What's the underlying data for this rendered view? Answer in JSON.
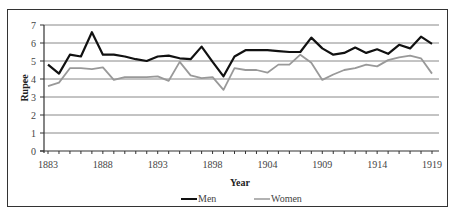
{
  "chart_data": {
    "type": "line",
    "title": "",
    "xlabel": "Year",
    "ylabel": "Rupee",
    "ylim": [
      0,
      7
    ],
    "yticks": [
      0,
      1,
      2,
      3,
      4,
      5,
      6,
      7
    ],
    "xtick_labels": [
      "1883",
      "1888",
      "1893",
      "1898",
      "1904",
      "1909",
      "1914",
      "1919"
    ],
    "x": [
      1883,
      1884,
      1885,
      1886,
      1887,
      1888,
      1889,
      1890,
      1891,
      1892,
      1893,
      1894,
      1895,
      1896,
      1897,
      1898,
      1899,
      1900,
      1902,
      1903,
      1904,
      1905,
      1906,
      1907,
      1908,
      1909,
      1910,
      1911,
      1912,
      1913,
      1914,
      1915,
      1916,
      1917,
      1918,
      1919
    ],
    "series": [
      {
        "name": "Men",
        "color": "#111111",
        "values": [
          4.8,
          4.3,
          5.35,
          5.25,
          6.6,
          5.35,
          5.35,
          5.25,
          5.1,
          5.0,
          5.25,
          5.3,
          5.15,
          5.1,
          5.8,
          4.95,
          4.15,
          5.25,
          5.6,
          5.6,
          5.6,
          5.55,
          5.5,
          5.5,
          6.3,
          5.7,
          5.35,
          5.45,
          5.75,
          5.45,
          5.65,
          5.4,
          5.9,
          5.7,
          6.35,
          5.95
        ]
      },
      {
        "name": "Women",
        "color": "#999999",
        "values": [
          3.6,
          3.8,
          4.6,
          4.6,
          4.55,
          4.65,
          3.95,
          4.1,
          4.1,
          4.1,
          4.15,
          3.9,
          4.95,
          4.2,
          4.05,
          4.1,
          3.4,
          4.6,
          4.5,
          4.5,
          4.35,
          4.8,
          4.8,
          5.35,
          4.9,
          3.95,
          4.25,
          4.5,
          4.6,
          4.8,
          4.7,
          5.05,
          5.2,
          5.3,
          5.15,
          4.3
        ]
      }
    ],
    "grid": true,
    "legend_position": "bottom"
  },
  "legend": {
    "items": [
      {
        "label": "Men",
        "color": "#111111"
      },
      {
        "label": "Women",
        "color": "#999999"
      }
    ]
  }
}
